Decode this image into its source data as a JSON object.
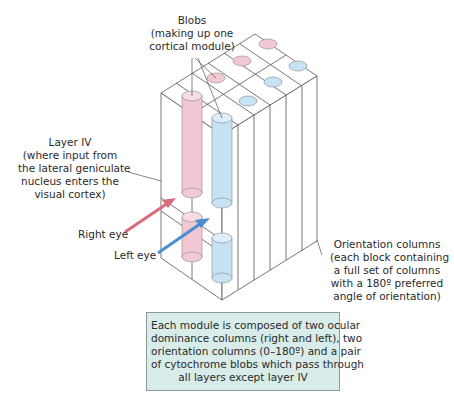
{
  "labels": {
    "blobs": [
      "Blobs",
      "(making up one",
      "cortical module)"
    ],
    "layer_iv": [
      "Layer IV",
      "(where input from",
      "the lateral geniculate",
      "nucleus enters the",
      "visual cortex)"
    ],
    "right_eye": "Right eye",
    "left_eye": "Left eye",
    "orientation": [
      "Orientation columns",
      "(each block containing",
      "a full set of columns",
      "with a 180º preferred",
      "angle of orientation)"
    ]
  },
  "caption": {
    "lines": [
      "Each module is composed of two ocular",
      "dominance columns (right and left), two",
      "orientation columns (0–180º) and a pair",
      "of cytochrome blobs which pass through",
      "all layers except layer IV"
    ]
  },
  "colors": {
    "right_eye": "#f2c9d2",
    "left_eye": "#c6e3f3",
    "right_arrow": "#d86b7c",
    "left_arrow": "#4b8fd0",
    "caption_bg": "#d8ecea",
    "line": "#555555"
  }
}
